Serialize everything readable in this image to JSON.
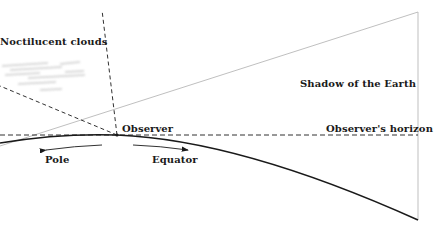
{
  "labels": {
    "noctilucent": "Noctilucent clouds",
    "shadow": "Shadow of the Earth",
    "observer": "Observer",
    "horizon": "Observer's horizon",
    "pole": "Pole",
    "equator": "Equator"
  },
  "colors": {
    "line_dark": "#1a1a1a",
    "line_light": "#b8b8b8",
    "cloud": "#cfcfcf"
  }
}
